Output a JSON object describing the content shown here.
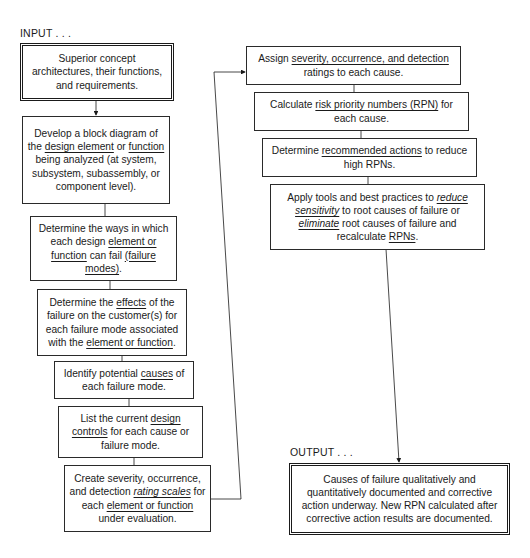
{
  "labels": {
    "input": "INPUT . . .",
    "output": "OUTPUT . . ."
  },
  "left_column": [
    {
      "id": "input-box",
      "segments": [
        [
          "Superior concept architectures, their functions, and requirements.",
          ""
        ]
      ]
    },
    {
      "id": "block-diagram",
      "segments": [
        [
          "Develop a block diagram of the ",
          ""
        ],
        [
          "design element",
          "u"
        ],
        [
          " or ",
          ""
        ],
        [
          "function",
          "u"
        ],
        [
          " being analyzed (at system, subsystem, subassembly, or component level).",
          ""
        ]
      ]
    },
    {
      "id": "failure-modes",
      "segments": [
        [
          "Determine the ways in which each design ",
          ""
        ],
        [
          "element or function",
          "u"
        ],
        [
          " can fail ",
          ""
        ],
        [
          "(failure modes)",
          "u"
        ],
        [
          ".",
          ""
        ]
      ]
    },
    {
      "id": "effects",
      "segments": [
        [
          "Determine the ",
          ""
        ],
        [
          "effects",
          "u"
        ],
        [
          " of the failure on the customer(s) for each failure mode associated with the ",
          ""
        ],
        [
          "element or function",
          "u"
        ],
        [
          ".",
          ""
        ]
      ]
    },
    {
      "id": "causes",
      "segments": [
        [
          "Identify potential ",
          ""
        ],
        [
          "causes",
          "u"
        ],
        [
          " of each failure mode.",
          ""
        ]
      ]
    },
    {
      "id": "design-controls",
      "segments": [
        [
          "List the current ",
          ""
        ],
        [
          "design controls",
          "u"
        ],
        [
          " for each cause or failure mode.",
          ""
        ]
      ]
    },
    {
      "id": "rating-scales",
      "segments": [
        [
          "Create severity, occurrence, and detection ",
          ""
        ],
        [
          "rating scales",
          "u i"
        ],
        [
          " for each ",
          ""
        ],
        [
          "element or function",
          "u"
        ],
        [
          " under evaluation.",
          ""
        ]
      ]
    }
  ],
  "right_column": [
    {
      "id": "assign-ratings",
      "segments": [
        [
          "Assign ",
          ""
        ],
        [
          "severity, occurrence, and detection",
          "u"
        ],
        [
          " ratings to each cause.",
          ""
        ]
      ]
    },
    {
      "id": "calculate-rpn",
      "segments": [
        [
          "Calculate ",
          ""
        ],
        [
          "risk priority numbers (RPN)",
          "u"
        ],
        [
          " for each cause.",
          ""
        ]
      ]
    },
    {
      "id": "recommended-actions",
      "segments": [
        [
          "Determine ",
          ""
        ],
        [
          "recommended actions",
          "u"
        ],
        [
          " to reduce high RPNs.",
          ""
        ]
      ]
    },
    {
      "id": "apply-tools",
      "segments": [
        [
          "Apply tools and best practices to ",
          ""
        ],
        [
          "reduce sensitivity",
          "u i"
        ],
        [
          " to root causes of failure or ",
          ""
        ],
        [
          "eliminate",
          "u i"
        ],
        [
          " root causes of failure and recalculate ",
          ""
        ],
        [
          "RPNs",
          "u"
        ],
        [
          ".",
          ""
        ]
      ]
    },
    {
      "id": "output-box",
      "segments": [
        [
          "Causes of failure qualitatively and quantitatively documented and corrective action underway. New RPN calculated after corrective action results are documented.",
          ""
        ]
      ]
    }
  ]
}
